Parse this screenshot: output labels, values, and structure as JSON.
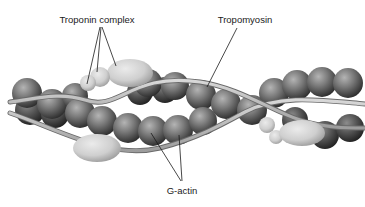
{
  "figure": {
    "labels": {
      "troponin": "Troponin complex",
      "tropomyosin": "Tropomyosin",
      "gactin": "G-actin"
    },
    "colors": {
      "background": "#ffffff",
      "actin_light": "#a8a8a8",
      "actin_dark": "#3a3a3a",
      "troponin_light": "#e0e0e0",
      "troponin_dark": "#a0a0a0",
      "tropomyosin_fill": "#c8c8c8",
      "tropomyosin_edge": "#6a6a6a",
      "leader_line": "#1a1a1a"
    }
  }
}
